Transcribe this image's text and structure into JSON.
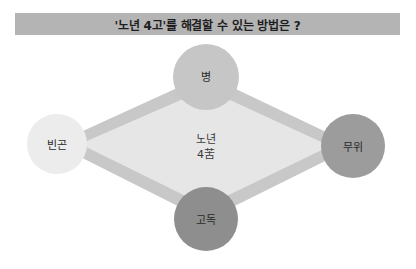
{
  "title": "'노년 4고'를 해결할 수 있는 방법은 ?",
  "center": {
    "line1": "노년",
    "line2": "4苦"
  },
  "nodes": {
    "top": {
      "label": "병",
      "color": "#c6c6c6"
    },
    "left": {
      "label": "빈곤",
      "color": "#ececec"
    },
    "right": {
      "label": "무위",
      "color": "#9c9c9c"
    },
    "bottom": {
      "label": "고독",
      "color": "#8e8e8e"
    }
  },
  "colors": {
    "title_bar": "#b4b4b4",
    "diamond_fill": "#e6e6e6",
    "diamond_border": "#c8c8c8"
  }
}
